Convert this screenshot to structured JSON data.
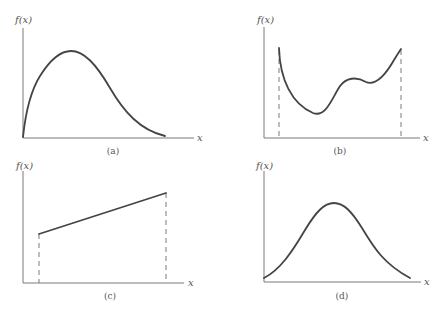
{
  "panels": [
    {
      "id": "a",
      "caption": "(a)",
      "ylabel": "f(x)",
      "xlabel": "x",
      "description": "Right-skewed unimodal curve starting at origin, rising steeply to a peak then decaying toward zero",
      "bounded": false
    },
    {
      "id": "b",
      "caption": "(b)",
      "ylabel": "f(x)",
      "xlabel": "x",
      "description": "Curve on a bounded interval: starts high, falls to a minimum, rises to a local maximum, dips slightly, then rises to the right endpoint",
      "bounded": true
    },
    {
      "id": "c",
      "caption": "(c)",
      "ylabel": "f(x)",
      "xlabel": "x",
      "description": "Straight increasing line segment on a bounded interval",
      "bounded": true
    },
    {
      "id": "d",
      "caption": "(d)",
      "ylabel": "f(x)",
      "xlabel": "x",
      "description": "Symmetric bell-shaped curve",
      "bounded": false
    }
  ],
  "colors": {
    "curve": "#444444",
    "axis": "#7a7a7a",
    "text": "#555555",
    "background": "#ffffff"
  }
}
